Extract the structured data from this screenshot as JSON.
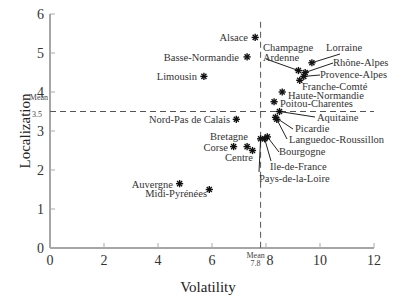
{
  "chart_data": {
    "type": "scatter",
    "title": "",
    "xlabel": "Volatility",
    "ylabel": "Localization",
    "xlim": [
      0,
      12
    ],
    "ylim": [
      0,
      6
    ],
    "xticks": [
      0,
      2,
      4,
      6,
      8,
      10,
      12
    ],
    "yticks": [
      0,
      1,
      2,
      3,
      4,
      5,
      6
    ],
    "grid": false,
    "marker": "asterisk",
    "reference_lines": [
      {
        "axis": "x",
        "value": 7.8,
        "label": "Mean 7.8",
        "style": "dashed"
      },
      {
        "axis": "y",
        "value": 3.5,
        "label": "Mean 3.5",
        "style": "dashed"
      }
    ],
    "points": [
      {
        "label": "Alsace",
        "x": 7.6,
        "y": 5.4
      },
      {
        "label": "Basse-Normandie",
        "x": 7.3,
        "y": 4.9
      },
      {
        "label": "Limousin",
        "x": 5.7,
        "y": 4.4
      },
      {
        "label": "Champagne Ardenne",
        "x": 9.2,
        "y": 4.55
      },
      {
        "label": "Lorraine",
        "x": 9.7,
        "y": 4.75
      },
      {
        "label": "Rhône-Alpes",
        "x": 9.45,
        "y": 4.5
      },
      {
        "label": "Provence-Alpes",
        "x": 9.4,
        "y": 4.4
      },
      {
        "label": "Franche-Comté",
        "x": 9.25,
        "y": 4.3
      },
      {
        "label": "Haute-Normandie",
        "x": 8.6,
        "y": 4.0
      },
      {
        "label": "Poitou-Charentes",
        "x": 8.3,
        "y": 3.75
      },
      {
        "label": "Aquitaine",
        "x": 8.5,
        "y": 3.5
      },
      {
        "label": "Picardie",
        "x": 8.35,
        "y": 3.35
      },
      {
        "label": "Languedoc-Roussillon",
        "x": 8.4,
        "y": 3.3
      },
      {
        "label": "Nord-Pas de Calais",
        "x": 6.9,
        "y": 3.3
      },
      {
        "label": "Bourgogne",
        "x": 8.05,
        "y": 2.85
      },
      {
        "label": "Ile-de-France",
        "x": 7.95,
        "y": 2.8
      },
      {
        "label": "Pays-de-la-Loire",
        "x": 7.8,
        "y": 2.8
      },
      {
        "label": "Bretagne",
        "x": 7.3,
        "y": 2.6
      },
      {
        "label": "Corse",
        "x": 6.8,
        "y": 2.6
      },
      {
        "label": "Centre",
        "x": 7.5,
        "y": 2.5
      },
      {
        "label": "Auvergne",
        "x": 4.8,
        "y": 1.65
      },
      {
        "label": "Midi-Pyrénées",
        "x": 5.9,
        "y": 1.5
      }
    ]
  },
  "labels": {
    "xlabel": "Volatility",
    "ylabel": "Localization",
    "mean_word": "Mean",
    "mean_x": "7.8",
    "mean_y": "3.5"
  }
}
